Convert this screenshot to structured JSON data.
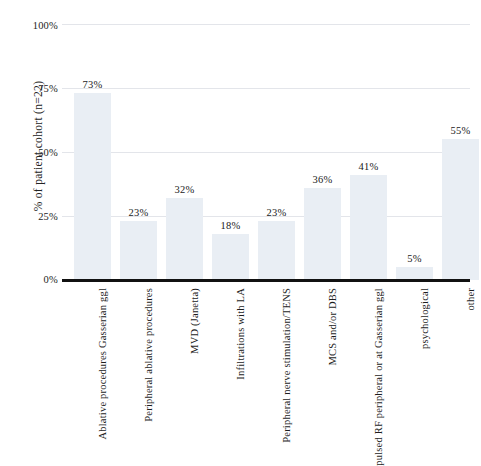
{
  "chart_data": {
    "type": "bar",
    "title": "",
    "xlabel": "",
    "ylabel": "% of  patient cohort (n=22)",
    "ylim": [
      0,
      100
    ],
    "ytick_labels": [
      "0%",
      "25%",
      "50%",
      "75%",
      "100%"
    ],
    "ytick_values": [
      0,
      25,
      50,
      75,
      100
    ],
    "grid": true,
    "legend": "none",
    "categories": [
      "Ablative procedures Gasserian ggl",
      "Peripheral ablative procedures",
      "MVD (Janetta)",
      "Infiltrations with LA",
      "Peripheral nerve stimulation/TENS",
      "MCS and/or DBS",
      "pulsed RF peripheral or at Gasserian ggl",
      "psychological",
      "other"
    ],
    "values": [
      73,
      23,
      32,
      18,
      23,
      36,
      41,
      5,
      55
    ],
    "value_labels": [
      "73%",
      "23%",
      "32%",
      "18%",
      "23%",
      "36%",
      "41%",
      "5%",
      "55%"
    ],
    "bar_color": "#e9eef4",
    "axis_color": "#111111",
    "grid_color": "#e3e5ea"
  }
}
